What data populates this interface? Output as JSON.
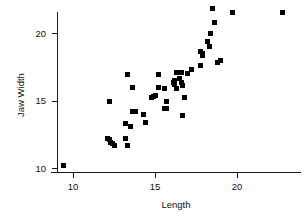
{
  "chart_data": {
    "type": "scatter",
    "title": "",
    "xlabel": "Length",
    "ylabel": "Jaw Width",
    "xlim": [
      9.0,
      23.2
    ],
    "ylim": [
      9.6,
      22.3
    ],
    "xticks": [
      10,
      15,
      20
    ],
    "xtick_labels": [
      "10",
      "15",
      "20"
    ],
    "yticks": [
      10,
      15,
      20
    ],
    "ytick_labels": [
      "10",
      "15",
      "20"
    ],
    "grid": false,
    "legend": null,
    "marker": {
      "shape": "square",
      "color": "#000000",
      "size_px": 5
    },
    "axis_color": "#1a1a1a",
    "background_color": "#ffffff",
    "n_points": 63,
    "points": [
      {
        "x": 9.4,
        "y": 10.2
      },
      {
        "x": 12.1,
        "y": 12.2
      },
      {
        "x": 12.2,
        "y": 12.1
      },
      {
        "x": 12.3,
        "y": 11.9
      },
      {
        "x": 12.4,
        "y": 11.8
      },
      {
        "x": 12.5,
        "y": 11.7
      },
      {
        "x": 12.2,
        "y": 14.9
      },
      {
        "x": 13.2,
        "y": 12.2
      },
      {
        "x": 13.3,
        "y": 11.7
      },
      {
        "x": 13.2,
        "y": 13.3
      },
      {
        "x": 13.5,
        "y": 13.1
      },
      {
        "x": 13.3,
        "y": 16.9
      },
      {
        "x": 13.6,
        "y": 16.0
      },
      {
        "x": 13.6,
        "y": 14.2
      },
      {
        "x": 13.8,
        "y": 14.2
      },
      {
        "x": 14.3,
        "y": 14.0
      },
      {
        "x": 14.4,
        "y": 13.4
      },
      {
        "x": 14.8,
        "y": 15.2
      },
      {
        "x": 14.9,
        "y": 15.3
      },
      {
        "x": 15.0,
        "y": 15.4
      },
      {
        "x": 15.2,
        "y": 16.0
      },
      {
        "x": 15.2,
        "y": 16.9
      },
      {
        "x": 15.6,
        "y": 15.9
      },
      {
        "x": 15.6,
        "y": 14.4
      },
      {
        "x": 15.7,
        "y": 14.4
      },
      {
        "x": 15.7,
        "y": 14.9
      },
      {
        "x": 16.1,
        "y": 16.3
      },
      {
        "x": 16.2,
        "y": 16.2
      },
      {
        "x": 16.2,
        "y": 16.5
      },
      {
        "x": 16.3,
        "y": 17.1
      },
      {
        "x": 16.3,
        "y": 15.9
      },
      {
        "x": 16.5,
        "y": 16.6
      },
      {
        "x": 16.6,
        "y": 16.3
      },
      {
        "x": 16.6,
        "y": 17.1
      },
      {
        "x": 16.7,
        "y": 16.1
      },
      {
        "x": 16.8,
        "y": 15.2
      },
      {
        "x": 16.7,
        "y": 13.9
      },
      {
        "x": 17.0,
        "y": 17.0
      },
      {
        "x": 17.2,
        "y": 17.3
      },
      {
        "x": 17.8,
        "y": 17.6
      },
      {
        "x": 17.9,
        "y": 18.3
      },
      {
        "x": 17.8,
        "y": 18.6
      },
      {
        "x": 17.9,
        "y": 18.5
      },
      {
        "x": 18.2,
        "y": 19.4
      },
      {
        "x": 18.3,
        "y": 19.0
      },
      {
        "x": 18.4,
        "y": 20.0
      },
      {
        "x": 18.5,
        "y": 21.8
      },
      {
        "x": 18.6,
        "y": 20.8
      },
      {
        "x": 18.8,
        "y": 17.8
      },
      {
        "x": 19.0,
        "y": 18.0
      },
      {
        "x": 19.7,
        "y": 21.5
      },
      {
        "x": 22.8,
        "y": 21.5
      }
    ]
  }
}
